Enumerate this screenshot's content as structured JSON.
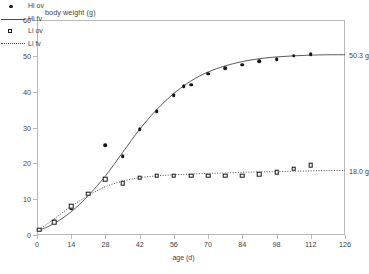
{
  "chart_data": {
    "type": "scatter",
    "title": "body weight (g)",
    "xlabel": "age (d)",
    "ylabel": "body weight (g)",
    "xlim": [
      0,
      126
    ],
    "ylim": [
      0,
      60
    ],
    "xticks": [
      0,
      14,
      28,
      42,
      56,
      70,
      84,
      98,
      112,
      126
    ],
    "yticks": [
      0,
      10,
      20,
      30,
      40,
      50,
      60
    ],
    "grid": false,
    "legend_position": "top-left",
    "legend": [
      {
        "label": "Hi ov",
        "marker": "filled-circle"
      },
      {
        "label": "Hi fv",
        "marker": "solid-line"
      },
      {
        "label": "Li ov",
        "marker": "open-square"
      },
      {
        "label": "Li fv",
        "marker": "dotted-line"
      }
    ],
    "annotations": [
      {
        "text": "50.3 g",
        "x": 120,
        "y": 50.3
      },
      {
        "text": "18.0 g",
        "x": 120,
        "y": 18.0
      }
    ],
    "series": [
      {
        "name": "Hi ov",
        "marker": "filled-circle",
        "x": [
          1,
          7,
          14,
          21,
          28,
          35,
          42,
          49,
          56,
          60,
          63,
          70,
          77,
          84,
          91,
          98,
          105,
          112
        ],
        "y": [
          1.5,
          4.0,
          7.5,
          11.5,
          25.0,
          22.0,
          29.5,
          34.5,
          39.0,
          41.5,
          42.0,
          45.0,
          46.5,
          47.5,
          48.5,
          49.0,
          50.0,
          50.5
        ]
      },
      {
        "name": "Hi fv",
        "marker": "solid-line",
        "x": [
          0,
          7,
          14,
          21,
          28,
          35,
          42,
          49,
          56,
          63,
          70,
          77,
          84,
          91,
          98,
          105,
          112,
          119,
          126
        ],
        "y": [
          1.0,
          3.2,
          6.5,
          11.0,
          16.5,
          23.0,
          29.5,
          35.0,
          39.5,
          43.0,
          45.5,
          47.2,
          48.4,
          49.2,
          49.7,
          50.0,
          50.2,
          50.3,
          50.3
        ]
      },
      {
        "name": "Li ov",
        "marker": "open-square",
        "x": [
          1,
          7,
          14,
          21,
          28,
          35,
          42,
          49,
          56,
          63,
          70,
          77,
          84,
          91,
          98,
          105,
          112
        ],
        "y": [
          1.5,
          3.5,
          8.0,
          11.5,
          15.5,
          14.5,
          16.0,
          16.5,
          16.5,
          16.5,
          16.5,
          16.5,
          16.5,
          17.0,
          17.5,
          18.5,
          19.5
        ]
      },
      {
        "name": "Li fv",
        "marker": "dotted-line",
        "x": [
          0,
          7,
          14,
          21,
          28,
          35,
          42,
          49,
          56,
          63,
          70,
          77,
          84,
          91,
          98,
          105,
          112,
          119,
          126
        ],
        "y": [
          1.0,
          4.5,
          8.0,
          11.0,
          13.5,
          15.0,
          16.0,
          16.5,
          16.8,
          17.0,
          17.2,
          17.3,
          17.5,
          17.6,
          17.7,
          17.8,
          17.9,
          18.0,
          18.0
        ]
      }
    ]
  }
}
